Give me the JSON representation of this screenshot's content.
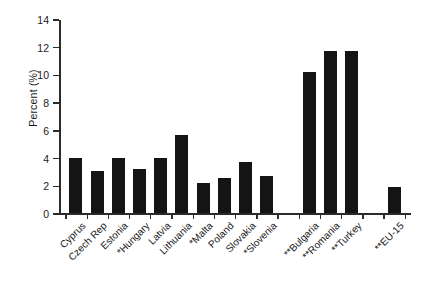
{
  "chart_data": {
    "type": "bar",
    "title": "",
    "subtitle": "",
    "xlabel": "",
    "ylabel": "Percent (%)",
    "ylim": [
      0,
      14
    ],
    "yticks": [
      0,
      2,
      4,
      6,
      8,
      10,
      12,
      14
    ],
    "ytick_labels": [
      "0",
      "2",
      "4",
      "6",
      "8",
      "10",
      "12",
      "14"
    ],
    "grid": false,
    "legend": null,
    "bar_color": "#141414",
    "axis_color": "#2b2b2b",
    "categories": [
      "Cyprus",
      "Czech Rep",
      "Estonia",
      "*Hungary",
      "Latvia",
      "Lithuania",
      "*Malta",
      "Poland",
      "Slovakia",
      "*Slovenia",
      "**Bulgaria",
      "**Romania",
      "**Turkey",
      "**EU-15"
    ],
    "values": [
      4.0,
      3.0,
      4.0,
      3.2,
      4.0,
      5.6,
      2.2,
      2.5,
      3.7,
      2.7,
      10.2,
      11.7,
      11.7,
      1.9
    ],
    "groups": [
      {
        "name": "new-member-states",
        "start": 0,
        "end": 9
      },
      {
        "name": "candidate-countries",
        "start": 10,
        "end": 12
      },
      {
        "name": "eu-15-reference",
        "start": 13,
        "end": 13
      }
    ]
  }
}
